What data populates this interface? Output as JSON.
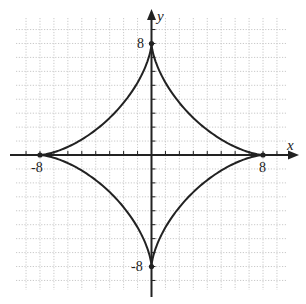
{
  "chart_data": {
    "type": "line",
    "title": "",
    "xlabel": "x",
    "ylabel": "y",
    "xlim": [
      -10,
      10
    ],
    "ylim": [
      -10,
      10
    ],
    "grid": true,
    "grid_spacing": 1,
    "tick_labels": {
      "x": [
        "-8",
        "8"
      ],
      "y": [
        "8",
        "-8"
      ]
    },
    "series": [
      {
        "name": "astroid x^(2/3) + y^(2/3) = 8^(2/3)",
        "equation": "x^(2/3) + y^(2/3) = 4",
        "cusps": [
          [
            8,
            0
          ],
          [
            0,
            8
          ],
          [
            -8,
            0
          ],
          [
            0,
            -8
          ]
        ],
        "color": "#222222"
      }
    ],
    "marked_points": [
      [
        8,
        0
      ],
      [
        -8,
        0
      ],
      [
        0,
        8
      ],
      [
        0,
        -8
      ]
    ]
  },
  "labels": {
    "x_axis": "x",
    "y_axis": "y",
    "x_pos": "8",
    "x_neg": "-8",
    "y_pos": "8",
    "y_neg": "-8"
  }
}
